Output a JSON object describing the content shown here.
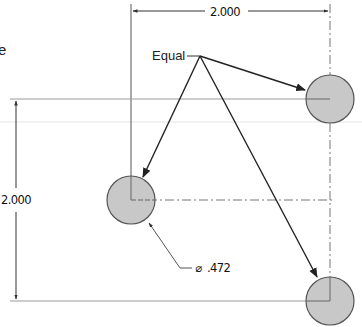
{
  "drawing": {
    "partial_text": "e",
    "equal_note": "Equal",
    "horizontal_dimension": "2.000",
    "vertical_dimension": "2.000",
    "diameter_symbol": "⌀",
    "diameter_value": ".472",
    "hole_fill": "#c8c8c8",
    "hole_stroke": "#555555",
    "line_color": "#222222",
    "extension_color": "#9a9a9a",
    "holes": [
      {
        "name": "top-right-hole",
        "cx": 330,
        "cy": 99,
        "r": 24
      },
      {
        "name": "middle-left-hole",
        "cx": 131,
        "cy": 200,
        "r": 24
      },
      {
        "name": "bottom-right-hole",
        "cx": 330,
        "cy": 301,
        "r": 24
      }
    ]
  }
}
